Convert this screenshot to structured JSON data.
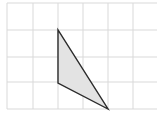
{
  "diagram": {
    "type": "grid-with-triangle",
    "grid": {
      "x_lines": [
        7,
        33,
        58,
        83,
        108,
        133
      ],
      "y_lines": [
        3,
        30,
        57,
        82,
        109
      ],
      "x_min": 7,
      "x_max": 157,
      "y_min": 3,
      "y_max": 109,
      "line_color": "#d9d9d9",
      "columns": 6,
      "rows": 4
    },
    "triangle": {
      "vertices": [
        {
          "label": "top",
          "x": 58,
          "y": 30
        },
        {
          "label": "bottom-left",
          "x": 58,
          "y": 83
        },
        {
          "label": "bottom-right",
          "x": 108,
          "y": 109
        }
      ],
      "grid_vertices": [
        {
          "col": 2,
          "row": 1
        },
        {
          "col": 2,
          "row": 3
        },
        {
          "col": 4,
          "row": 4
        }
      ],
      "fill": "#e3e3e3",
      "stroke": "#2b2b2b",
      "stroke_width": 1.4
    }
  }
}
